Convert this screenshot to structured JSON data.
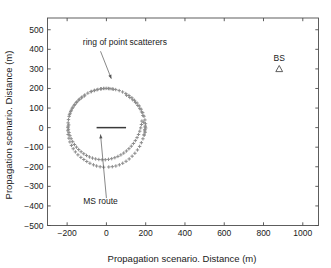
{
  "figure": {
    "background_color": "#ffffff",
    "axis_color": "#4d4d4d",
    "text_color": "#1a1a1a",
    "scatter_color": "#8c8c8c",
    "route_color": "#3a3a3a",
    "arrow_color": "#555555"
  },
  "chart_data": {
    "type": "scatter",
    "title": "",
    "xlabel": "Propagation scenario. Distance (m)",
    "ylabel": "Propagation scenario. Distance (m)",
    "xlim": [
      -300,
      1080
    ],
    "ylim": [
      -500,
      560
    ],
    "xticks": [
      -200,
      0,
      200,
      400,
      600,
      800,
      1000
    ],
    "xticklabels": [
      "-200",
      "0",
      "200",
      "400",
      "600",
      "800",
      "1000"
    ],
    "yticks": [
      -500,
      -400,
      -300,
      -200,
      -100,
      0,
      100,
      200,
      300,
      400,
      500
    ],
    "yticklabels": [
      "-500",
      "-400",
      "-300",
      "-200",
      "-100",
      "0",
      "100",
      "200",
      "300",
      "400",
      "500"
    ],
    "grid": false,
    "legend": "none",
    "series": [
      {
        "name": "ring of point scatterers",
        "marker": "plus",
        "color": "#8c8c8c",
        "center": [
          0,
          0
        ],
        "radius": 200,
        "points": [
          [
            199.0,
            19.9
          ],
          [
            196.1,
            39.2
          ],
          [
            191.3,
            58.1
          ],
          [
            184.8,
            76.5
          ],
          [
            176.6,
            94.0
          ],
          [
            166.9,
            110.5
          ],
          [
            155.8,
            125.6
          ],
          [
            143.3,
            139.4
          ],
          [
            129.6,
            152.3
          ],
          [
            114.7,
            163.9
          ],
          [
            98.9,
            173.8
          ],
          [
            82.4,
            182.2
          ],
          [
            65.1,
            189.1
          ],
          [
            47.4,
            194.3
          ],
          [
            29.3,
            197.8
          ],
          [
            11.0,
            199.7
          ],
          [
            -7.3,
            199.9
          ],
          [
            -25.6,
            198.4
          ],
          [
            -43.6,
            195.2
          ],
          [
            -61.2,
            190.4
          ],
          [
            -78.2,
            184.0
          ],
          [
            -94.5,
            176.2
          ],
          [
            -110.0,
            166.9
          ],
          [
            -124.5,
            156.4
          ],
          [
            -137.9,
            144.8
          ],
          [
            -150.1,
            132.1
          ],
          [
            -161.0,
            118.5
          ],
          [
            -170.5,
            104.1
          ],
          [
            -178.5,
            89.0
          ],
          [
            -185.0,
            73.4
          ],
          [
            -189.9,
            57.3
          ],
          [
            -193.2,
            40.9
          ],
          [
            -194.9,
            24.4
          ],
          [
            -195.0,
            7.8
          ],
          [
            -193.4,
            -8.8
          ],
          [
            -190.3,
            -25.2
          ],
          [
            -185.6,
            -41.3
          ],
          [
            -179.4,
            -56.9
          ],
          [
            -171.8,
            -71.9
          ],
          [
            -162.8,
            -86.2
          ],
          [
            -152.6,
            -99.6
          ],
          [
            -141.2,
            -112.1
          ],
          [
            -128.8,
            -123.4
          ],
          [
            -115.4,
            -133.5
          ],
          [
            -101.2,
            -142.3
          ],
          [
            -86.3,
            -149.7
          ],
          [
            -70.8,
            -155.6
          ],
          [
            -54.9,
            -160.0
          ],
          [
            -38.6,
            -162.9
          ],
          [
            -22.2,
            -164.2
          ],
          [
            -5.7,
            -163.9
          ],
          [
            10.7,
            -162.0
          ],
          [
            27.0,
            -158.6
          ],
          [
            43.0,
            -153.6
          ],
          [
            58.6,
            -147.1
          ],
          [
            73.7,
            -139.2
          ],
          [
            88.1,
            -130.0
          ],
          [
            101.8,
            -119.4
          ],
          [
            114.7,
            -107.7
          ],
          [
            126.6,
            -94.9
          ],
          [
            137.5,
            -81.1
          ],
          [
            147.3,
            -66.4
          ],
          [
            156.0,
            -51.0
          ],
          [
            163.5,
            -34.9
          ],
          [
            169.7,
            -18.3
          ],
          [
            174.7,
            -1.3
          ],
          [
            178.4,
            16.0
          ],
          [
            180.8,
            33.5
          ],
          [
            -196.0,
            0.0
          ],
          [
            -192.0,
            14.0
          ],
          [
            196.0,
            -10.0
          ],
          [
            190.0,
            27.0
          ],
          [
            -30.0,
            198.0
          ],
          [
            -15.0,
            200.0
          ],
          [
            2.0,
            200.5
          ],
          [
            18.0,
            199.0
          ],
          [
            35.0,
            196.0
          ],
          [
            -48.0,
            193.5
          ],
          [
            -62.0,
            189.0
          ],
          [
            -77.0,
            184.5
          ],
          [
            198.0,
            8.0
          ],
          [
            200.0,
            -2.0
          ],
          [
            197.0,
            -24.0
          ],
          [
            193.0,
            -38.0
          ],
          [
            -14.0,
            -202.0
          ],
          [
            -32.0,
            -200.0
          ],
          [
            -50.0,
            -196.0
          ],
          [
            -66.0,
            -190.0
          ],
          [
            -84.0,
            -182.0
          ],
          [
            -100.0,
            -173.0
          ],
          [
            -115.0,
            -163.0
          ],
          [
            -130.0,
            -152.0
          ],
          [
            -145.0,
            -139.0
          ],
          [
            -158.0,
            -124.0
          ],
          [
            -169.0,
            -108.0
          ],
          [
            -178.0,
            -91.0
          ],
          [
            -186.0,
            -73.0
          ],
          [
            -191.0,
            -54.0
          ],
          [
            -195.0,
            -35.0
          ],
          [
            -196.5,
            -16.0
          ],
          [
            12.0,
            -201.0
          ],
          [
            30.0,
            -199.5
          ],
          [
            48.0,
            -196.0
          ],
          [
            66.0,
            -190.0
          ],
          [
            83.0,
            -182.0
          ],
          [
            100.0,
            -172.0
          ],
          [
            116.0,
            -160.0
          ],
          [
            131.0,
            -146.0
          ],
          [
            145.0,
            -131.0
          ],
          [
            158.0,
            -114.0
          ],
          [
            169.0,
            -96.0
          ],
          [
            178.0,
            -77.0
          ],
          [
            186.0,
            -57.0
          ],
          [
            191.0,
            -37.0
          ],
          [
            195.0,
            -17.0
          ],
          [
            197.0,
            3.0
          ],
          [
            186.0,
            62.0
          ],
          [
            179.0,
            80.0
          ],
          [
            170.0,
            97.0
          ],
          [
            160.0,
            113.0
          ],
          [
            148.0,
            128.0
          ],
          [
            134.0,
            142.0
          ],
          [
            119.0,
            154.0
          ],
          [
            103.0,
            165.0
          ],
          [
            -188.0,
            66.0
          ],
          [
            -182.0,
            83.0
          ],
          [
            -174.0,
            99.0
          ],
          [
            -164.0,
            114.0
          ],
          [
            -153.0,
            128.0
          ],
          [
            -141.0,
            141.0
          ],
          [
            -127.0,
            152.0
          ],
          [
            -112.0,
            162.0
          ]
        ]
      },
      {
        "name": "MS route",
        "marker": "line",
        "color": "#3a3a3a",
        "x_start": -50,
        "x_end": 100,
        "y": 0
      },
      {
        "name": "BS",
        "marker": "triangle",
        "color": "#4d4d4d",
        "position": [
          880,
          300
        ]
      }
    ],
    "annotations": [
      {
        "text": "ring of point scatterers",
        "text_x": -120,
        "text_y": 420,
        "arrow_from_x": -30,
        "arrow_from_y": 390,
        "arrow_to_x": 25,
        "arrow_to_y": 250
      },
      {
        "text": "MS route",
        "text_x": -30,
        "text_y": -390,
        "arrow_from_x": 0,
        "arrow_from_y": -360,
        "arrow_to_x": -30,
        "arrow_to_y": -35
      },
      {
        "text": "BS",
        "text_x": 880,
        "text_y": 340
      }
    ]
  }
}
